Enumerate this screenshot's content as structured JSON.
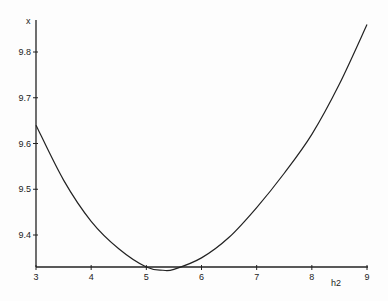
{
  "chart_data": {
    "type": "line",
    "title": "",
    "xlabel": "h2",
    "ylabel": "x",
    "xlim": [
      3,
      9
    ],
    "ylim": [
      9.315,
      9.87
    ],
    "xticks": [
      3,
      4,
      5,
      6,
      7,
      8,
      9
    ],
    "yticks": [
      9.4,
      9.5,
      9.6,
      9.7,
      9.8
    ],
    "grid": false,
    "legend": null,
    "series": [
      {
        "name": "x",
        "x": [
          3,
          3.5,
          4,
          4.5,
          5,
          5.3,
          5.5,
          6,
          6.5,
          7,
          7.5,
          8,
          8.5,
          9
        ],
        "values": [
          9.64,
          9.52,
          9.43,
          9.37,
          9.33,
          9.323,
          9.325,
          9.35,
          9.395,
          9.46,
          9.535,
          9.62,
          9.73,
          9.86
        ]
      }
    ]
  },
  "labels": {
    "ylabel": "x",
    "xlabel": "h2"
  }
}
